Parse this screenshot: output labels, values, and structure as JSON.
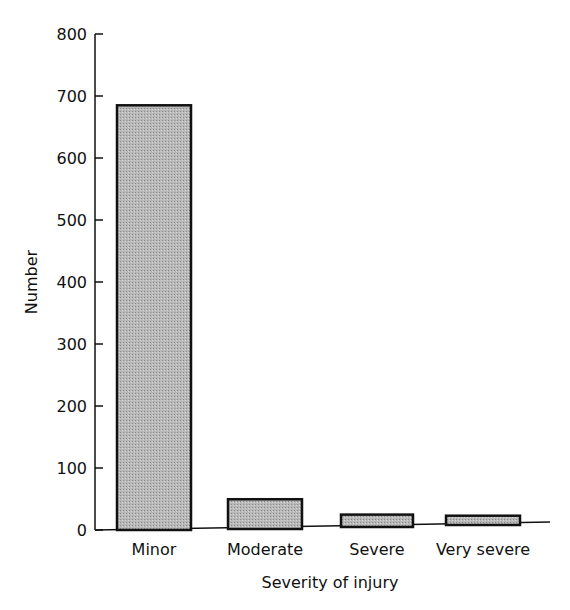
{
  "chart_data": {
    "type": "bar",
    "title": "",
    "xlabel": "Severity of injury",
    "ylabel": "Number",
    "categories": [
      "Minor",
      "Moderate",
      "Severe",
      "Very severe"
    ],
    "values": [
      685,
      48,
      20,
      15
    ],
    "ylim": [
      0,
      800
    ],
    "yticks": [
      0,
      100,
      200,
      300,
      400,
      500,
      600,
      700,
      800
    ],
    "grid": false,
    "legend": null,
    "bar_fill": "#b8b8b8",
    "bar_edge": "#111111"
  }
}
